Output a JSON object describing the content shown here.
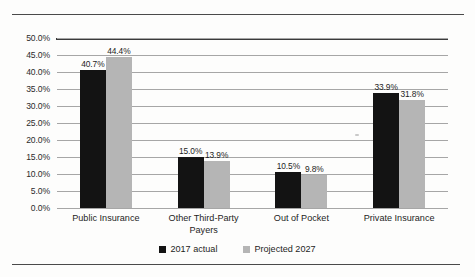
{
  "page": {
    "top_rule": "horizontal-rule",
    "bottom_rule": "horizontal-rule"
  },
  "chart_data": {
    "type": "bar",
    "title": "",
    "subtitle": "",
    "xlabel": "",
    "ylabel": "",
    "ylim": [
      0,
      50
    ],
    "ytick_labels": [
      "50.0%",
      "45.0%",
      "40.0%",
      "35.0%",
      "30.0%",
      "25.0%",
      "20.0%",
      "15.0%",
      "10.0%",
      "5.0%",
      "0.0%"
    ],
    "ytick_values": [
      50,
      45,
      40,
      35,
      30,
      25,
      20,
      15,
      10,
      5,
      0
    ],
    "grid": true,
    "legend_position": "bottom-center",
    "categories": [
      "Public Insurance",
      "Other Third-Party Payers",
      "Out of Pocket",
      "Private Insurance"
    ],
    "series": [
      {
        "name": "2017 actual",
        "color": "#131313",
        "values": [
          40.7,
          15.0,
          10.5,
          33.9
        ],
        "data_labels": [
          "40.7%",
          "15.0%",
          "10.5%",
          "33.9%"
        ]
      },
      {
        "name": "Projected 2027",
        "color": "#b5b5b5",
        "values": [
          44.4,
          13.9,
          9.8,
          31.8
        ],
        "data_labels": [
          "44.4%",
          "13.9%",
          "9.8%",
          "31.8%"
        ]
      }
    ]
  }
}
